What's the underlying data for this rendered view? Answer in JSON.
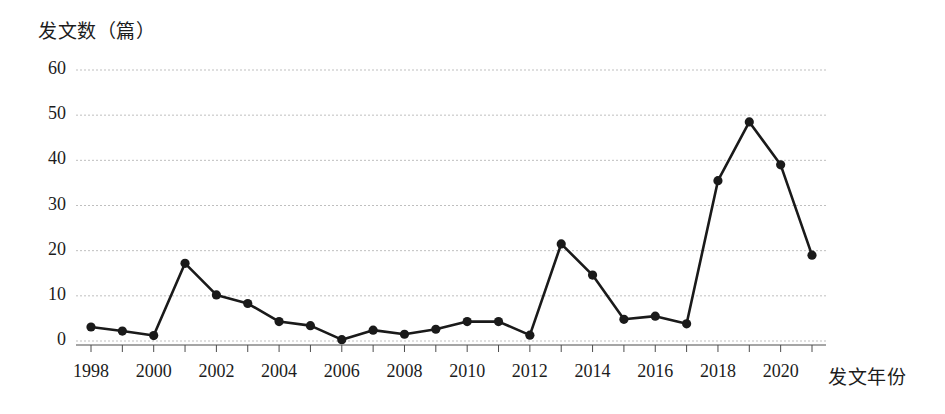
{
  "chart_data": {
    "type": "line",
    "title": "",
    "xlabel": "发文年份",
    "ylabel": "发文数（篇）",
    "x": [
      1998,
      1999,
      2000,
      2001,
      2002,
      2003,
      2004,
      2005,
      2006,
      2007,
      2008,
      2009,
      2010,
      2011,
      2012,
      2013,
      2014,
      2015,
      2016,
      2017,
      2018,
      2019,
      2020,
      2021
    ],
    "values": [
      3.1,
      2.2,
      1.2,
      17.2,
      10.2,
      8.3,
      4.3,
      3.4,
      0.3,
      2.4,
      1.5,
      2.6,
      4.3,
      4.3,
      1.3,
      21.5,
      14.6,
      4.8,
      5.5,
      3.8,
      35.5,
      48.5,
      39.0,
      19.0
    ],
    "series": [
      {
        "name": "发文数",
        "values": [
          3.1,
          2.2,
          1.2,
          17.2,
          10.2,
          8.3,
          4.3,
          3.4,
          0.3,
          2.4,
          1.5,
          2.6,
          4.3,
          4.3,
          1.3,
          21.5,
          14.6,
          4.8,
          5.5,
          3.8,
          35.5,
          48.5,
          39.0,
          19.0
        ]
      }
    ],
    "y_ticks": [
      0,
      10,
      20,
      30,
      40,
      50,
      60
    ],
    "x_ticks": [
      1998,
      2000,
      2002,
      2004,
      2006,
      2008,
      2010,
      2012,
      2014,
      2016,
      2018,
      2020
    ],
    "x_tick_labels": [
      "1998",
      "2000",
      "2002",
      "2004",
      "2006",
      "2008",
      "2010",
      "2012",
      "2014",
      "2016",
      "2018",
      "2020"
    ],
    "y_tick_labels": [
      "0",
      "10",
      "20",
      "30",
      "40",
      "50",
      "60"
    ],
    "ylim": [
      0,
      60
    ],
    "xlim": [
      1998,
      2021
    ],
    "grid": true,
    "grid_style": "dotted-horizontal",
    "legend": false,
    "legend_position": "none",
    "marker": "filled-circle",
    "line_color": "#1a1a1a",
    "marker_color": "#1a1a1a",
    "grid_color": "#bfbfbf",
    "axis_color": "#4d4d4d",
    "background": "#ffffff"
  }
}
